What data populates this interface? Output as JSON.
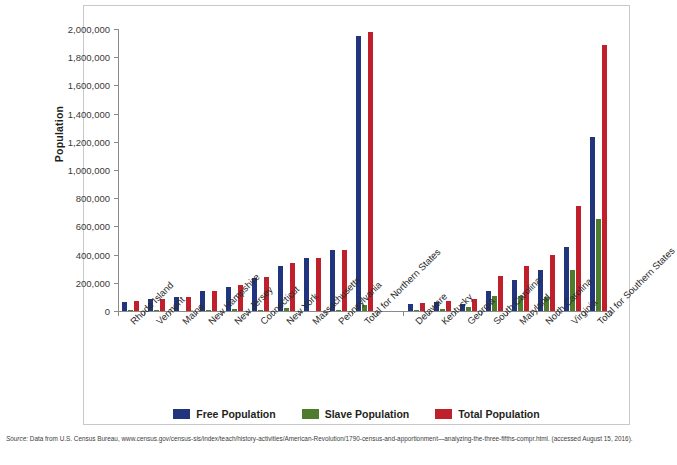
{
  "axis": {
    "ylabel": "Population",
    "yticks": [
      "0",
      "200,000",
      "400,000",
      "600,000",
      "800,000",
      "1,000,000",
      "1,200,000",
      "1,400,000",
      "1,600,000",
      "1,800,000",
      "2,000,000"
    ]
  },
  "legend": [
    {
      "label": "Free Population",
      "color": "#20357e",
      "name": "free-population"
    },
    {
      "label": "Slave Population",
      "color": "#4e7b2c",
      "name": "slave-population"
    },
    {
      "label": "Total Population",
      "color": "#c0202c",
      "name": "total-population"
    }
  ],
  "source": {
    "label": "Source:",
    "text": " Data from U.S. Census Bureau, www.census.gov/census-sis/index/teach/history-activities/American-Revolution/1790-census-and-apportionment—analyzing-the-three-fifths-compr.html. (accessed August 15, 2016)."
  },
  "chart_data": {
    "type": "bar",
    "title": "",
    "xlabel": "",
    "ylabel": "Population",
    "ylim": [
      0,
      2000000
    ],
    "ytick_step": 200000,
    "grid": false,
    "legend_position": "bottom",
    "categories": [
      "Rhode Island",
      "Vermont",
      "Maine",
      "New Hampshire",
      "New Jersey",
      "Connecticut",
      "New York",
      "Massachusetts",
      "Pennsylvania",
      "Total for Northern States",
      "",
      "Delaware",
      "Kentucky",
      "Georgia",
      "South Carolina",
      "Maryland",
      "North Carolina",
      "Virginia",
      "Total for Southern States"
    ],
    "series": [
      {
        "name": "Free Population",
        "color": "#20357e",
        "values": [
          64470,
          85341,
          96540,
          141727,
          172716,
          232374,
          318796,
          378556,
          430636,
          1950000,
          null,
          46310,
          61247,
          53284,
          141979,
          216692,
          293179,
          454983,
          1235000
        ]
      },
      {
        "name": "Slave Population",
        "color": "#4e7b2c",
        "values": [
          948,
          16,
          0,
          158,
          11423,
          2764,
          21324,
          0,
          3737,
          40000,
          null,
          8887,
          12430,
          29264,
          107094,
          103036,
          100572,
          292627,
          654000
        ]
      },
      {
        "name": "Total Population",
        "color": "#c0202c",
        "values": [
          68825,
          85341,
          96540,
          141885,
          184139,
          237946,
          340120,
          378556,
          434373,
          1980000,
          null,
          59096,
          73677,
          82548,
          249073,
          319728,
          393751,
          747610,
          1885000
        ]
      }
    ]
  }
}
